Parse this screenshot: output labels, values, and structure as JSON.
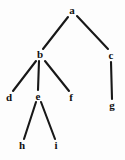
{
  "figure": {
    "name": "tree-diagram",
    "width": 125,
    "height": 160,
    "background_color": "#fdfdfd",
    "edge_color": "#181818",
    "label_color": "#101010"
  },
  "chart_data": {
    "type": "diagram",
    "diagram_type": "tree",
    "title": "",
    "root": "a",
    "nodes": [
      {
        "id": "a",
        "label": "a",
        "x": 72,
        "y": 10,
        "depth": 0,
        "parent": null
      },
      {
        "id": "b",
        "label": "b",
        "x": 40,
        "y": 54,
        "depth": 1,
        "parent": "a"
      },
      {
        "id": "c",
        "label": "c",
        "x": 111,
        "y": 55,
        "depth": 1,
        "parent": "a"
      },
      {
        "id": "d",
        "label": "d",
        "x": 9,
        "y": 97,
        "depth": 2,
        "parent": "b"
      },
      {
        "id": "e",
        "label": "e",
        "x": 38,
        "y": 96,
        "depth": 2,
        "parent": "b"
      },
      {
        "id": "f",
        "label": "f",
        "x": 71,
        "y": 97,
        "depth": 2,
        "parent": "b"
      },
      {
        "id": "g",
        "label": "g",
        "x": 112,
        "y": 105,
        "depth": 2,
        "parent": "c"
      },
      {
        "id": "h",
        "label": "h",
        "x": 22,
        "y": 145,
        "depth": 3,
        "parent": "e"
      },
      {
        "id": "i",
        "label": "i",
        "x": 56,
        "y": 145,
        "depth": 3,
        "parent": "e"
      }
    ],
    "edges": [
      {
        "from": "a",
        "to": "b",
        "x1": 68,
        "y1": 17,
        "x2": 43,
        "y2": 49
      },
      {
        "from": "a",
        "to": "c",
        "x1": 77,
        "y1": 16,
        "x2": 108,
        "y2": 49
      },
      {
        "from": "b",
        "to": "d",
        "x1": 36,
        "y1": 61,
        "x2": 13,
        "y2": 91
      },
      {
        "from": "b",
        "to": "e",
        "x1": 39,
        "y1": 61,
        "x2": 38,
        "y2": 90
      },
      {
        "from": "b",
        "to": "f",
        "x1": 45,
        "y1": 61,
        "x2": 69,
        "y2": 91
      },
      {
        "from": "c",
        "to": "g",
        "x1": 111,
        "y1": 62,
        "x2": 112,
        "y2": 99
      },
      {
        "from": "e",
        "to": "h",
        "x1": 36,
        "y1": 102,
        "x2": 24,
        "y2": 139
      },
      {
        "from": "e",
        "to": "i",
        "x1": 41,
        "y1": 102,
        "x2": 55,
        "y2": 139
      }
    ]
  }
}
